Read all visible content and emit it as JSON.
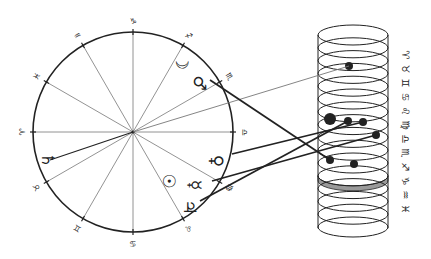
{
  "diagram": {
    "title": "",
    "colors": {
      "ink": "#222222",
      "thin_line": "#777777",
      "shaded_ring": "#9a9a9a",
      "background": "#ffffff"
    },
    "wheel": {
      "center": [
        133,
        132
      ],
      "radius": 100,
      "sign_ticks": [
        {
          "name": "capricorn",
          "glyph": "♑",
          "angle": -90
        },
        {
          "name": "sagittarius",
          "glyph": "♐",
          "angle": -60
        },
        {
          "name": "scorpio",
          "glyph": "♏",
          "angle": -30
        },
        {
          "name": "libra",
          "glyph": "♎",
          "angle": 0
        },
        {
          "name": "virgo",
          "glyph": "♍",
          "angle": 30
        },
        {
          "name": "leo",
          "glyph": "♌",
          "angle": 60
        },
        {
          "name": "cancer",
          "glyph": "♋",
          "angle": 90
        },
        {
          "name": "gemini",
          "glyph": "♊",
          "angle": 120
        },
        {
          "name": "taurus",
          "glyph": "♉",
          "angle": 150
        },
        {
          "name": "aries",
          "glyph": "♈",
          "angle": 180
        },
        {
          "name": "pisces",
          "glyph": "♓",
          "angle": 210
        },
        {
          "name": "aquarius",
          "glyph": "♒",
          "angle": 240
        }
      ],
      "planets": [
        {
          "name": "moon",
          "glyph": "☽",
          "x": 182,
          "y": 62
        },
        {
          "name": "mars",
          "glyph": "♂",
          "x": 200,
          "y": 83
        },
        {
          "name": "saturn",
          "glyph": "♄",
          "x": 48,
          "y": 160
        },
        {
          "name": "venus",
          "glyph": "♀",
          "x": 217,
          "y": 161
        },
        {
          "name": "sun",
          "glyph": "☉",
          "x": 169,
          "y": 181
        },
        {
          "name": "mercury",
          "glyph": "☿",
          "x": 195,
          "y": 185
        },
        {
          "name": "jupiter",
          "glyph": "♃",
          "x": 190,
          "y": 207
        }
      ]
    },
    "cylinder": {
      "left": 318,
      "right": 388,
      "top_y": 35,
      "bottom_y": 227,
      "ring_ry": 10,
      "shaded_ring_index": 11,
      "sign_labels": [
        {
          "name": "aries",
          "glyph": "♈"
        },
        {
          "name": "taurus",
          "glyph": "♉"
        },
        {
          "name": "gemini",
          "glyph": "♊"
        },
        {
          "name": "cancer",
          "glyph": "♋"
        },
        {
          "name": "leo",
          "glyph": "♌"
        },
        {
          "name": "virgo",
          "glyph": "♍"
        },
        {
          "name": "libra",
          "glyph": "♎"
        },
        {
          "name": "scorpio",
          "glyph": "♏"
        },
        {
          "name": "sagittarius",
          "glyph": "♐"
        },
        {
          "name": "capricorn",
          "glyph": "♑"
        },
        {
          "name": "aquarius",
          "glyph": "♒"
        },
        {
          "name": "pisces",
          "glyph": "♓"
        }
      ],
      "dots": [
        {
          "x": 349,
          "y": 66,
          "r": 4
        },
        {
          "x": 330,
          "y": 119,
          "r": 6
        },
        {
          "x": 348,
          "y": 121,
          "r": 4
        },
        {
          "x": 363,
          "y": 122,
          "r": 4
        },
        {
          "x": 376,
          "y": 135,
          "r": 4
        },
        {
          "x": 330,
          "y": 160,
          "r": 4
        },
        {
          "x": 354,
          "y": 164,
          "r": 4
        }
      ]
    },
    "connectors": [
      {
        "from": [
          133,
          132
        ],
        "to": [
          349,
          66
        ],
        "weight": "thin"
      },
      {
        "from": [
          210,
          80
        ],
        "to": [
          330,
          160
        ],
        "weight": "thick"
      },
      {
        "from": [
          232,
          154
        ],
        "to": [
          363,
          122
        ],
        "weight": "thick"
      },
      {
        "from": [
          212,
          181
        ],
        "to": [
          376,
          135
        ],
        "weight": "thick"
      },
      {
        "from": [
          200,
          201
        ],
        "to": [
          348,
          121
        ],
        "weight": "thick"
      },
      {
        "from": [
          133,
          132
        ],
        "to": [
          50,
          160
        ],
        "weight": "medium"
      }
    ]
  }
}
